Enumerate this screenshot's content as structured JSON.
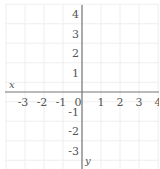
{
  "chart_data": {
    "type": "coordinate-plane",
    "title": "",
    "xlabel": "x",
    "ylabel": "y",
    "x_ticks": [
      -3,
      -2,
      -1,
      0,
      1,
      2,
      3,
      4
    ],
    "y_ticks": [
      4,
      3,
      2,
      1,
      -1,
      -2,
      -3
    ],
    "xlim": [
      -3.5,
      4.2
    ],
    "ylim": [
      -3.6,
      4.3
    ],
    "grid": true,
    "series": []
  },
  "colors": {
    "axis": "#777777",
    "grid": "#eeeeee",
    "label": "#555555",
    "background": "#ffffff"
  }
}
